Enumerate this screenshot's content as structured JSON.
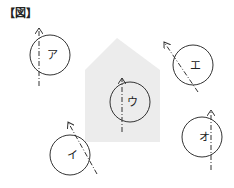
{
  "figure_label": "【図】",
  "colors": {
    "line": "#333333",
    "house_fill": "#ececec",
    "background": "#ffffff"
  },
  "house": {
    "points": "117,38 160,70 160,142 85,142 85,70",
    "description": "gray house-shaped region (pentagon)"
  },
  "circles": [
    {
      "id": "a",
      "label": "ア",
      "cx": 50,
      "cy": 55,
      "r": 20,
      "arrow": {
        "x1": 39,
        "y1": 86,
        "x2": 39,
        "y2": 28,
        "direction": "up"
      }
    },
    {
      "id": "e",
      "label": "エ",
      "cx": 193,
      "cy": 65,
      "r": 20,
      "arrow": {
        "x1": 198,
        "y1": 92,
        "x2": 164,
        "y2": 42,
        "direction": "up-left"
      }
    },
    {
      "id": "u",
      "label": "ウ",
      "cx": 130,
      "cy": 102,
      "r": 20,
      "arrow": {
        "x1": 122,
        "y1": 132,
        "x2": 122,
        "y2": 78,
        "direction": "up"
      }
    },
    {
      "id": "i",
      "label": "イ",
      "cx": 70,
      "cy": 155,
      "r": 20,
      "arrow": {
        "x1": 97,
        "y1": 174,
        "x2": 68,
        "y2": 122,
        "direction": "up-left"
      }
    },
    {
      "id": "o",
      "label": "オ",
      "cx": 202,
      "cy": 137,
      "r": 20,
      "arrow": {
        "x1": 211,
        "y1": 170,
        "x2": 211,
        "y2": 110,
        "direction": "up"
      }
    }
  ]
}
